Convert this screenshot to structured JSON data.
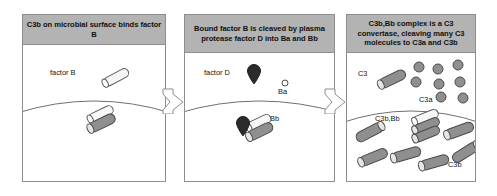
{
  "diagram": {
    "colors": {
      "header_band": "#b3b3b3",
      "panel_border": "#8d8d8d",
      "surface_line": "#6f6f6f",
      "rod_gray": "#8f8f8f",
      "rod_white": "#f2f2f2",
      "factor_d_dark": "#2b2b2b",
      "circle_gray": "#8f8f8f",
      "background": "#ffffff"
    },
    "panels": [
      {
        "id": "panel-1",
        "header": "C3b on microbial surface binds factor B",
        "labels": [
          {
            "name": "factor-b-label",
            "text": "factor B"
          }
        ],
        "molecules": [
          {
            "name": "factor-b-rod",
            "kind": "rod",
            "fill": "white"
          },
          {
            "name": "c3b-rod-white",
            "kind": "rod",
            "fill": "white"
          },
          {
            "name": "c3b-rod-gray",
            "kind": "rod",
            "fill": "gray"
          }
        ]
      },
      {
        "id": "panel-2",
        "header": "Bound factor B is cleaved by plasma protease factor D into Ba and Bb",
        "labels": [
          {
            "name": "factor-d-label",
            "text": "factor D"
          },
          {
            "name": "ba-label",
            "text": "Ba"
          },
          {
            "name": "bb-label",
            "text": "Bb"
          }
        ],
        "molecules": [
          {
            "name": "factor-d-teardrop",
            "kind": "teardrop",
            "fill": "dark"
          },
          {
            "name": "ba-circle",
            "kind": "circle",
            "fill": "white"
          },
          {
            "name": "bound-factor-d-teardrop",
            "kind": "teardrop",
            "fill": "dark"
          },
          {
            "name": "bb-rod-white",
            "kind": "rod",
            "fill": "white"
          },
          {
            "name": "bb-rod-gray",
            "kind": "rod",
            "fill": "gray"
          }
        ]
      },
      {
        "id": "panel-3",
        "header": "C3b,Bb complex is a C3 convertase, cleaving many C3 molecules to C3a and C3b",
        "labels": [
          {
            "name": "c3-label",
            "text": "C3"
          },
          {
            "name": "c3a-label",
            "text": "C3a"
          },
          {
            "name": "c3b-bb-label",
            "text": "C3b,Bb"
          },
          {
            "name": "c3b-label",
            "text": "C3b"
          }
        ],
        "molecules": {
          "c3_rod_count": 1,
          "c3a_circle_count": 8,
          "c3b_rod_count": 6,
          "convertase_rod_count": 3
        }
      }
    ],
    "arrows": [
      {
        "name": "arrow-panel1-to-panel2",
        "direction": "right"
      },
      {
        "name": "arrow-panel2-to-panel3",
        "direction": "right"
      }
    ]
  }
}
